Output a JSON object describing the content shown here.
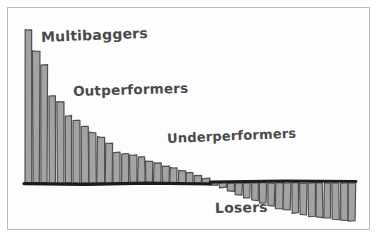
{
  "figure": {
    "style": "hand-drawn-sketch",
    "background_color": "#fdfdfd",
    "frame_color": "#b9b9b9",
    "bar_fill_color": "#a3a3a3",
    "bar_stroke_color": "#4f4f4f",
    "baseline_color": "#1c1c1c",
    "label_color": "#4a4a4a"
  },
  "annotations": {
    "multibaggers": "Multibaggers",
    "outperformers": "Outperformers",
    "underperformers": "Underperformers",
    "losers": "Losers"
  },
  "chart_data": {
    "type": "bar",
    "title": "",
    "subtitle": "",
    "xlabel": "",
    "ylabel": "",
    "grid": false,
    "legend": "none",
    "axis_visible": [
      "baseline"
    ],
    "xlim": [
      0,
      41
    ],
    "ylim": [
      -42,
      100
    ],
    "baseline_value": 0,
    "tick_labels_x": [],
    "tick_labels_y": [],
    "categories": [
      "1",
      "2",
      "3",
      "4",
      "5",
      "6",
      "7",
      "8",
      "9",
      "10",
      "11",
      "12",
      "13",
      "14",
      "15",
      "16",
      "17",
      "18",
      "19",
      "20",
      "21",
      "22",
      "23",
      "24",
      "25",
      "26",
      "27",
      "28",
      "29",
      "30",
      "31",
      "32",
      "33",
      "34",
      "35",
      "36",
      "37",
      "38",
      "39",
      "40",
      "41"
    ],
    "values": [
      100,
      86,
      77,
      57,
      53,
      44,
      41,
      37,
      33,
      30,
      26,
      20,
      19,
      18,
      17,
      14,
      13,
      11,
      10,
      8,
      7,
      5,
      3,
      -2,
      -5,
      -9,
      -13,
      -16,
      -19,
      -22,
      -25,
      -28,
      -30,
      -33,
      -35,
      -37,
      -38,
      -39,
      -40,
      -41,
      -42
    ],
    "segments": [
      {
        "name": "Multibaggers",
        "start_index": 0,
        "end_index": 4,
        "sign": "positive"
      },
      {
        "name": "Outperformers",
        "start_index": 5,
        "end_index": 13,
        "sign": "positive"
      },
      {
        "name": "Underperformers",
        "start_index": 14,
        "end_index": 22,
        "sign": "positive"
      },
      {
        "name": "Losers",
        "start_index": 23,
        "end_index": 40,
        "sign": "negative"
      }
    ],
    "annotation_positions": [
      {
        "text": "Multibaggers",
        "x_px": 41,
        "y_px": 29
      },
      {
        "text": "Outperformers",
        "x_px": 73,
        "y_px": 83
      },
      {
        "text": "Underperformers",
        "x_px": 167,
        "y_px": 131
      },
      {
        "text": "Losers",
        "x_px": 215,
        "y_px": 200
      }
    ]
  }
}
